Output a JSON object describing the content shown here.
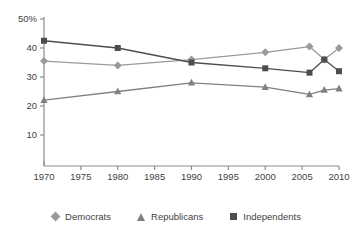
{
  "chart_data": {
    "type": "line",
    "title": "",
    "subtitle": "",
    "xlabel": "",
    "ylabel": "",
    "x": [
      1970,
      1980,
      1990,
      2000,
      2006,
      2008,
      2010
    ],
    "xlim": [
      1970,
      2010
    ],
    "ylim": [
      0,
      50
    ],
    "grid": false,
    "legend_position": "bottom",
    "x_tick_labels": [
      "1970",
      "1975",
      "1980",
      "1985",
      "1990",
      "1995",
      "2000",
      "2005",
      "2010"
    ],
    "x_tick_values": [
      1970,
      1975,
      1980,
      1985,
      1990,
      1995,
      2000,
      2005,
      2010
    ],
    "y_tick_labels": [
      "10",
      "20",
      "30",
      "40",
      "50%"
    ],
    "y_tick_values": [
      10,
      20,
      30,
      40,
      50
    ],
    "series": [
      {
        "name": "Democrats",
        "marker": "diamond",
        "color": "#9a9a9a",
        "values": [
          35.5,
          34.0,
          36.0,
          38.5,
          40.5,
          36.0,
          40.0
        ]
      },
      {
        "name": "Republicans",
        "marker": "triangle",
        "color": "#808080",
        "values": [
          22.0,
          25.0,
          28.0,
          26.5,
          24.0,
          25.5,
          26.0
        ]
      },
      {
        "name": "Independents",
        "marker": "square",
        "color": "#4d4d4d",
        "values": [
          42.5,
          40.0,
          35.0,
          33.0,
          31.5,
          36.0,
          32.0
        ]
      }
    ]
  },
  "legend": {
    "items": [
      {
        "label": "Democrats",
        "marker": "diamond",
        "color": "#9a9a9a"
      },
      {
        "label": "Republicans",
        "marker": "triangle",
        "color": "#808080"
      },
      {
        "label": "Independents",
        "marker": "square",
        "color": "#4d4d4d"
      }
    ]
  },
  "axis": {
    "line_color": "#8c8c8c"
  }
}
